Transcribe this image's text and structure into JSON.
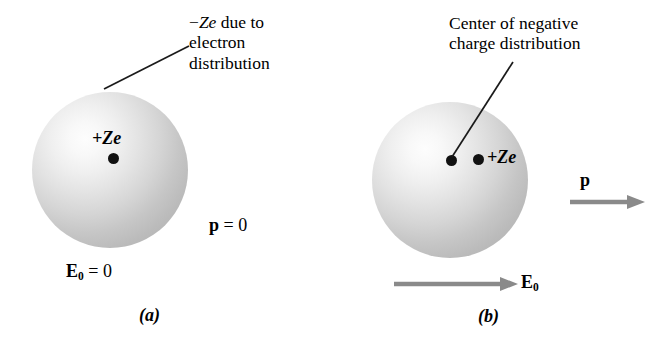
{
  "figure": {
    "background_color": "#ffffff",
    "arrow_color": "#8a8a8a",
    "sphere_color": "#cfcfcf",
    "dot_color": "#111111"
  },
  "panel_a": {
    "caption": "(a)",
    "annotation_line1": "−Ze due to",
    "annotation_line2": "electron",
    "annotation_line3": "distribution",
    "annotation_sign": "−",
    "annotation_Z": "Z",
    "annotation_e": "e",
    "annotation_rest": " due to",
    "nucleus_label_sign": "+",
    "nucleus_label_Z": "Z",
    "nucleus_label_e": "e",
    "nucleus_label": "+Ze",
    "dipole_symbol": "p",
    "dipole_value": " = 0",
    "dipole_label": "p = 0",
    "field_symbol": "E",
    "field_subscript": "0",
    "field_value": " = 0",
    "field_label": "E0 = 0"
  },
  "panel_b": {
    "caption": "(b)",
    "annotation_line1": "Center of negative",
    "annotation_line2": "charge distribution",
    "nucleus_label_sign": "+",
    "nucleus_label_Z": "Z",
    "nucleus_label_e": "e",
    "nucleus_label": "+Ze",
    "dipole_symbol": "p",
    "field_symbol": "E",
    "field_subscript": "0"
  }
}
